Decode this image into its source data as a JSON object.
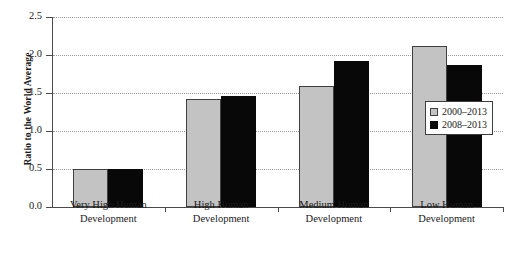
{
  "chart_data": {
    "type": "bar",
    "title": "",
    "xlabel": "",
    "ylabel": "Ratio to the World Average",
    "ylim": [
      0.0,
      2.5
    ],
    "ytick_labels": [
      "0.0",
      "0.5",
      "1.0",
      "1.5",
      "2.0",
      "2.5"
    ],
    "ytick_values": [
      0.0,
      0.5,
      1.0,
      1.5,
      2.0,
      2.5
    ],
    "grid": true,
    "grid_axis": "y",
    "legend_position": "right",
    "categories": [
      "Very High Human Development",
      "High Human Development",
      "Medium Human Development",
      "Low Human Development"
    ],
    "category_lines": [
      [
        "Very High Human",
        "Development"
      ],
      [
        "High Human",
        "Development"
      ],
      [
        "Medium Human",
        "Development"
      ],
      [
        "Low Human",
        "Development"
      ]
    ],
    "series": [
      {
        "name": "2000–2013",
        "color": "#c3c3c3",
        "values": [
          0.5,
          1.42,
          1.59,
          2.12
        ]
      },
      {
        "name": "2008–2013",
        "color": "#080808",
        "values": [
          0.5,
          1.46,
          1.92,
          1.87
        ]
      }
    ]
  },
  "legend": {
    "items": [
      {
        "label": "2000–2013",
        "swatch": "light-gray-square"
      },
      {
        "label": "2008–2013",
        "swatch": "black-square"
      }
    ]
  }
}
